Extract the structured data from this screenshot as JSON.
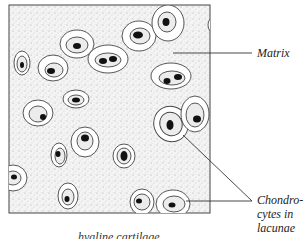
{
  "figure": {
    "labels": {
      "matrix": "Matrix",
      "chondrocytes_line1": "Chondro-",
      "chondrocytes_line2": "cytes in",
      "chondrocytes_line3": "lacunae"
    },
    "caption_partial": "hyaline cartilage"
  },
  "colors": {
    "background": "#ffffff",
    "outline": "#444444",
    "nucleus": "#111111",
    "matrix_stipple": "#9a9a9a"
  }
}
